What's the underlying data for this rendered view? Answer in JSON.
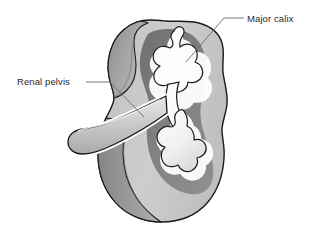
{
  "figure": {
    "background_color": "#ffffff"
  },
  "labels": [
    {
      "id": "major-calix",
      "text": "Major calix",
      "color": "#2b2b2b"
    },
    {
      "id": "renal-pelvis",
      "text": "Renal pelvis",
      "color": "#2b2b2b"
    }
  ],
  "colors": {
    "outline": "#1a1a1a",
    "cortex_light": "#c9c9c9",
    "cortex_mid": "#b4b4b4",
    "cut_edge_dark": "#8f8f8f",
    "medulla_dark": "#787878",
    "calyx_white": "#fbfbfb",
    "leader_line": "#5a5a5a",
    "background": "#ffffff"
  },
  "structures": {
    "cortex": "renal-cortex-outline",
    "cut_surface": "renal-cut-surface",
    "medulla": "renal-medulla-region",
    "calyces": "branching-calyces",
    "pelvis_tube": "renal-pelvis-ureter-tube"
  }
}
